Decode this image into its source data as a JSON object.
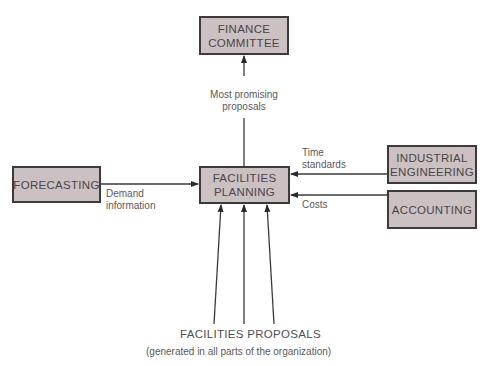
{
  "diagram": {
    "nodes": {
      "finance": {
        "label": "FINANCE\nCOMMITTEE"
      },
      "forecasting": {
        "label": "FORECASTING"
      },
      "planning": {
        "label": "FACILITIES\nPLANNING"
      },
      "industrial": {
        "label": "INDUSTRIAL\nENGINEERING"
      },
      "accounting": {
        "label": "ACCOUNTING"
      }
    },
    "edges": {
      "planning_to_finance": {
        "label": "Most promising\nproposals"
      },
      "forecasting_to_planning": {
        "label": "Demand\ninformation"
      },
      "industrial_to_planning": {
        "label": "Time\nstandards"
      },
      "accounting_to_planning": {
        "label": "Costs"
      }
    },
    "source": {
      "title": "FACILITIES PROPOSALS",
      "subtitle": "(generated in all parts of the organization)"
    },
    "colors": {
      "box_fill": "#cbc1c3",
      "box_border": "#3d3a3b",
      "line": "#3a3a3a"
    }
  }
}
